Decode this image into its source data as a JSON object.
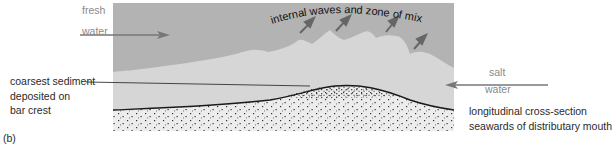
{
  "figure": {
    "panel_label": "(b)",
    "fresh_water": [
      "fresh",
      "water"
    ],
    "salt_water": [
      "salt",
      "water"
    ],
    "mixing_label": "internal waves and zone of mixing",
    "sediment_label": [
      "coarsest sediment",
      "deposited on",
      "bar crest"
    ],
    "caption": [
      "longitudinal cross-section",
      "seawards of distributary mouth"
    ],
    "colors": {
      "fresh_water": "#b3b3b3",
      "salt_water": "#d6d6d6",
      "sediment": "#ececec",
      "arrow": "#777777",
      "outline": "#1a1a1a"
    }
  }
}
